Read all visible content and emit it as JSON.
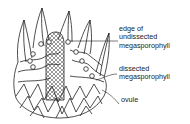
{
  "figure": {
    "labels": [
      {
        "lines": [
          "edge of",
          "undissected",
          "megasporophyll"
        ]
      },
      {
        "lines": [
          "dissected",
          "megasporophyll"
        ]
      },
      {
        "lines": [
          "ovule"
        ]
      }
    ]
  }
}
